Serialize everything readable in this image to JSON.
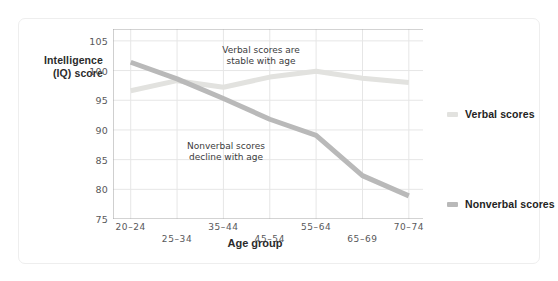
{
  "chart_data": {
    "type": "line",
    "title": "",
    "subtitle": "",
    "xlabel": "Age group",
    "ylabel": "Intelligence\n(IQ) score",
    "ylabel_lines": [
      "Intelligence",
      "(IQ) score"
    ],
    "categories": [
      "20–24",
      "25–34",
      "35–44",
      "45–54",
      "55–64",
      "65–69",
      "70–74"
    ],
    "ylim": [
      75,
      107
    ],
    "yticks": [
      75,
      80,
      85,
      90,
      95,
      100,
      105
    ],
    "ytick_labels": [
      "75",
      "80",
      "85",
      "90",
      "95",
      "100",
      "105"
    ],
    "grid": true,
    "legend_position": "right",
    "series": [
      {
        "name": "Verbal scores",
        "color": "#e2e2df",
        "values": [
          96.6,
          98.3,
          97.2,
          98.9,
          99.9,
          98.7,
          98.0
        ]
      },
      {
        "name": "Nonverbal scores",
        "color": "#b9b9b9",
        "values": [
          101.4,
          98.6,
          95.3,
          91.8,
          89.1,
          82.3,
          78.9
        ]
      }
    ],
    "annotations": [
      {
        "id": "verbal-annotation",
        "text": "Verbal scores are\nstable with age",
        "x_category": "35–44",
        "y_value": 104.5
      },
      {
        "id": "nonverbal-annotation",
        "text": "Nonverbal scores\ndecline with age",
        "x_category": "25–34",
        "y_value": 86.5
      }
    ]
  },
  "legend": {
    "items": [
      {
        "label": "Verbal scores",
        "color": "#e2e2df"
      },
      {
        "label": "Nonverbal scores",
        "color": "#b9b9b9"
      }
    ]
  },
  "colors": {
    "card_background": "#ffffff",
    "card_border": "#eeeeee",
    "grid": "#e6e6e6",
    "axis": "#a8a8a8",
    "tick_text": "#58585a",
    "title_text": "#2b2b2b",
    "verbal_series": "#e2e2df",
    "nonverbal_series": "#b9b9b9"
  }
}
